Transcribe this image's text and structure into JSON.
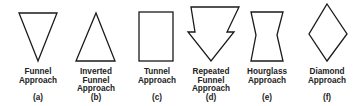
{
  "diagram": {
    "items": [
      {
        "name": "funnel",
        "lines": [
          "Funnel",
          "Approach"
        ],
        "letter": "(a)",
        "cx": 38
      },
      {
        "name": "inverted-funnel",
        "lines": [
          "Inverted",
          "Funnel",
          "Approach"
        ],
        "letter": "(b)",
        "cx": 96
      },
      {
        "name": "tunnel",
        "lines": [
          "Tunnel",
          "Approach"
        ],
        "letter": "(c)",
        "cx": 157
      },
      {
        "name": "repeated-funnel",
        "lines": [
          "Repeated",
          "Funnel",
          "Approach"
        ],
        "letter": "(d)",
        "cx": 211
      },
      {
        "name": "hourglass",
        "lines": [
          "Hourglass",
          "Approach"
        ],
        "letter": "(e)",
        "cx": 267
      },
      {
        "name": "diamond",
        "lines": [
          "Diamond",
          "Approach"
        ],
        "letter": "(f)",
        "cx": 327
      }
    ],
    "stroke_color": "#1a1a1a"
  }
}
